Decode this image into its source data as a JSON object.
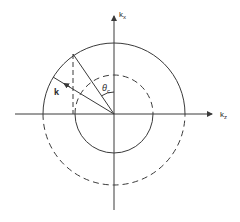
{
  "diagram": {
    "labels": {
      "vertical_axis": "k",
      "vertical_axis_sub": "x",
      "horizontal_axis": "k",
      "horizontal_axis_sub": "z",
      "vector": "k",
      "angle": "θ",
      "angle_sub": "c"
    },
    "colors": {
      "line": "#3a3a3a",
      "background": "#ffffff"
    },
    "geometry": {
      "center": [
        114,
        114
      ],
      "outer_radius": 71,
      "inner_radius": 39,
      "outer_circle_style": "upper half solid, lower half dashed",
      "inner_circle_style": "upper half dashed, lower half solid"
    }
  }
}
